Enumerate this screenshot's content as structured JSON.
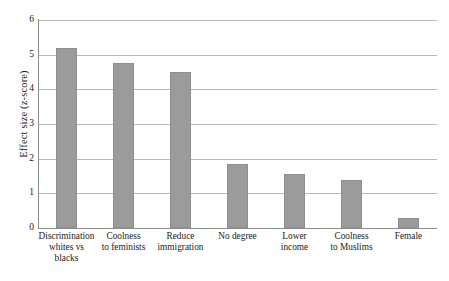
{
  "chart_data": {
    "type": "bar",
    "title": "",
    "xlabel": "",
    "ylabel": "Effect size (z-score)",
    "ylim": [
      0,
      6
    ],
    "yticks": [
      "0",
      "1",
      "2",
      "3",
      "4",
      "5",
      "6"
    ],
    "grid": true,
    "legend": null,
    "bar_color": "#9b9b9b",
    "grid_color": "#b9b9b9",
    "axis_color": "#8d8d8d",
    "categories": [
      "Discrimination\nwhites vs\nblacks",
      "Coolness\nto feminists",
      "Reduce\nimmigration",
      "No degree",
      "Lower\nincome",
      "Coolness\nto Muslims",
      "Female"
    ],
    "values": [
      5.2,
      4.75,
      4.5,
      1.85,
      1.55,
      1.4,
      0.3
    ]
  }
}
